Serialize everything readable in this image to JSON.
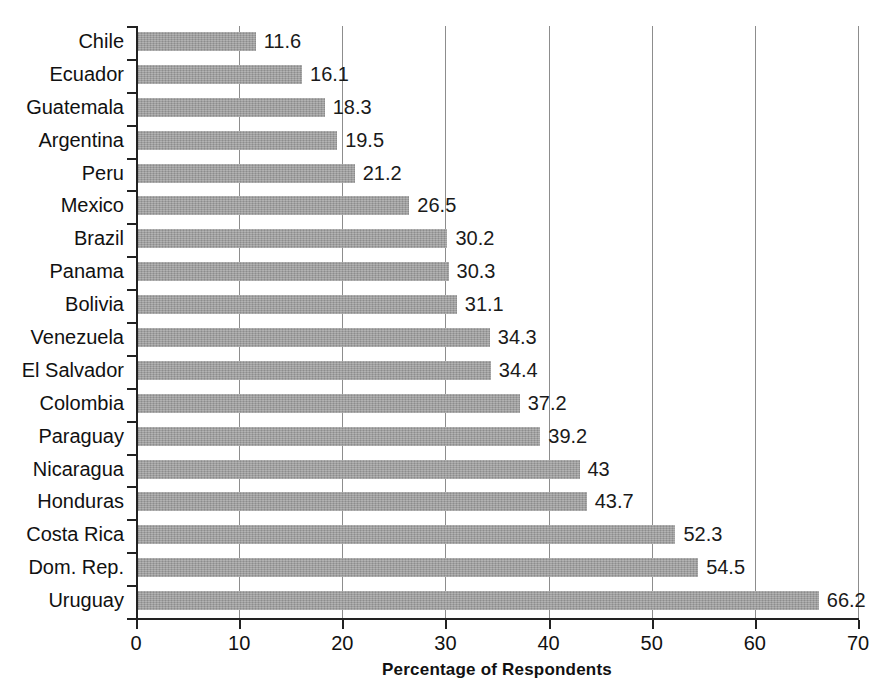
{
  "chart_data": {
    "type": "bar",
    "orientation": "horizontal",
    "title": "",
    "xlabel": "Percentage of Respondents",
    "ylabel": "",
    "xlim": [
      0,
      70
    ],
    "xticks": [
      0,
      10,
      20,
      30,
      40,
      50,
      60,
      70
    ],
    "grid": "vertical",
    "legend": "none",
    "bar_color": "#9c9c9c",
    "categories": [
      "Chile",
      "Ecuador",
      "Guatemala",
      "Argentina",
      "Peru",
      "Mexico",
      "Brazil",
      "Panama",
      "Bolivia",
      "Venezuela",
      "El Salvador",
      "Colombia",
      "Paraguay",
      "Nicaragua",
      "Honduras",
      "Costa Rica",
      "Dom. Rep.",
      "Uruguay"
    ],
    "values": [
      11.6,
      16.1,
      18.3,
      19.5,
      21.2,
      26.5,
      30.2,
      30.3,
      31.1,
      34.3,
      34.4,
      37.2,
      39.2,
      43,
      43.7,
      52.3,
      54.5,
      66.2
    ],
    "value_labels": [
      "11.6",
      "16.1",
      "18.3",
      "19.5",
      "21.2",
      "26.5",
      "30.2",
      "30.3",
      "31.1",
      "34.3",
      "34.4",
      "37.2",
      "39.2",
      "43",
      "43.7",
      "52.3",
      "54.5",
      "66.2"
    ],
    "xtick_labels": [
      "0",
      "10",
      "20",
      "30",
      "40",
      "50",
      "60",
      "70"
    ]
  }
}
